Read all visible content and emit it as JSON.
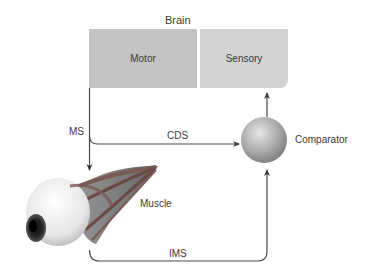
{
  "title": "Brain",
  "boxes": {
    "motor": "Motor",
    "sensory": "Sensory"
  },
  "nodes": {
    "comparator": "Comparator",
    "muscle": "Muscle"
  },
  "signals": {
    "ms": "MS",
    "cds": "CDS",
    "ims": "IMS"
  },
  "colors": {
    "motor_box": "#c4c4c4",
    "sensory_box": "#d2d2d2",
    "line": "#4a4a4a",
    "muscle": "#8a5a55"
  }
}
